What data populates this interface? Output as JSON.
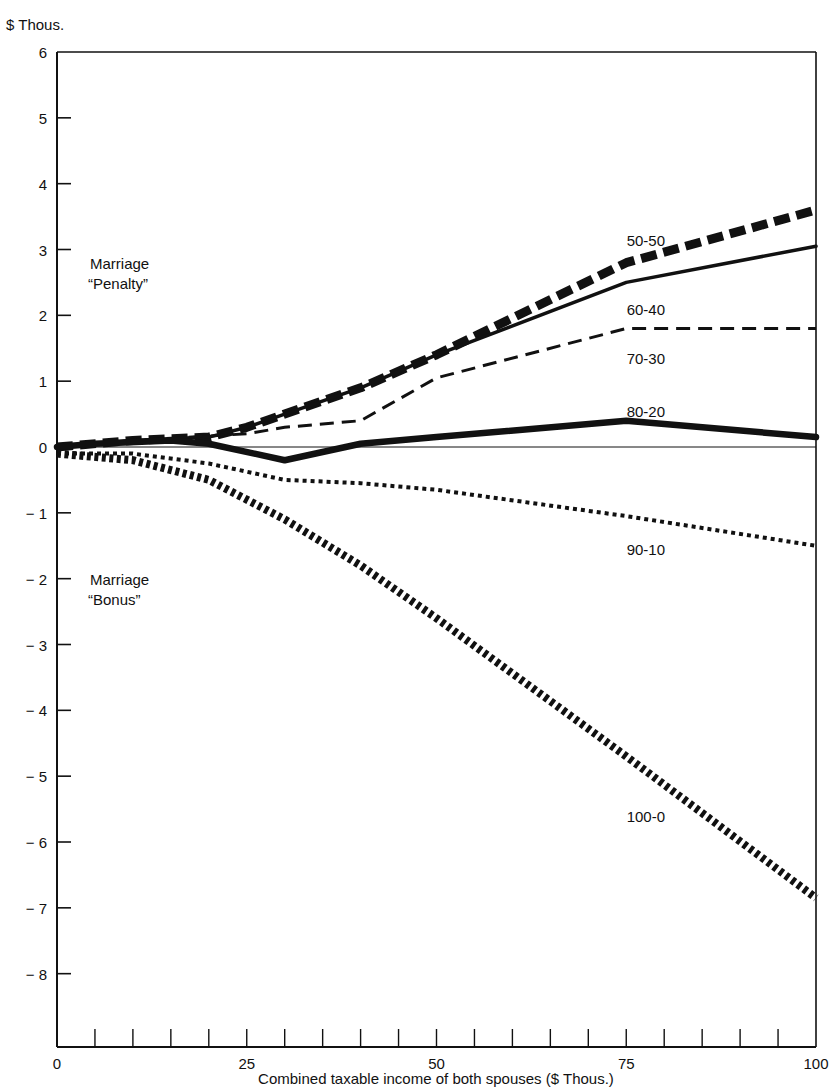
{
  "chart_data": {
    "type": "line",
    "title": "",
    "ylabel": "$ Thous.",
    "xlabel": "Combined taxable income of both spouses ($ Thous.)",
    "xlim": [
      0,
      100
    ],
    "ylim": [
      -9,
      6
    ],
    "x_ticks_labeled": [
      0,
      25,
      50,
      75,
      100
    ],
    "x_minor_tick_step": 5,
    "y_ticks": [
      6,
      5,
      4,
      3,
      2,
      1,
      0,
      -1,
      -2,
      -3,
      -4,
      -5,
      -6,
      -7,
      -8
    ],
    "y_tick_labels": [
      "6",
      "5",
      "4",
      "3",
      "2",
      "1",
      "0",
      "− 1",
      "− 2",
      "− 3",
      "− 4",
      "− 5",
      "− 6",
      "− 7",
      "− 8"
    ],
    "grid": false,
    "zero_line": true,
    "legend": "inline labels",
    "annotations": [
      {
        "text": "Marriage",
        "line2": "“Penalty”",
        "x": 4,
        "y": 2.7
      },
      {
        "text": "Marriage",
        "line2": "“Bonus”",
        "x": 4,
        "y": -2.1
      }
    ],
    "series": [
      {
        "name": "50-50",
        "style": "heavy-dash",
        "x": [
          0,
          10,
          20,
          25,
          30,
          40,
          50,
          75,
          100
        ],
        "values": [
          0,
          0.1,
          0.15,
          0.3,
          0.5,
          0.9,
          1.4,
          2.8,
          3.6
        ],
        "label_pos": [
          74,
          3.15
        ]
      },
      {
        "name": "60-40",
        "style": "solid-medium",
        "x": [
          0,
          10,
          20,
          25,
          30,
          40,
          50,
          75,
          100
        ],
        "values": [
          0,
          0.1,
          0.15,
          0.3,
          0.5,
          0.9,
          1.4,
          2.5,
          3.05
        ],
        "label_pos": [
          74,
          2.1
        ]
      },
      {
        "name": "70-30",
        "style": "dash",
        "x": [
          0,
          10,
          25,
          30,
          40,
          50,
          75,
          100
        ],
        "values": [
          0,
          0.1,
          0.2,
          0.3,
          0.4,
          1.05,
          1.8,
          1.8
        ],
        "label_pos": [
          74,
          1.35
        ]
      },
      {
        "name": "80-20",
        "style": "solid-heavy",
        "x": [
          0,
          5,
          15,
          20,
          30,
          40,
          50,
          75,
          100
        ],
        "values": [
          0,
          0.05,
          0.1,
          0.05,
          -0.2,
          0.05,
          0.15,
          0.4,
          0.15
        ],
        "label_pos": [
          74,
          0.55
        ]
      },
      {
        "name": "90-10",
        "style": "dotted",
        "x": [
          0,
          10,
          20,
          30,
          40,
          50,
          75,
          100
        ],
        "values": [
          -0.1,
          -0.1,
          -0.25,
          -0.5,
          -0.55,
          -0.65,
          -1.05,
          -1.5
        ],
        "label_pos": [
          74,
          -1.55
        ]
      },
      {
        "name": "100-0",
        "style": "heavy-dotted",
        "x": [
          0,
          10,
          20,
          30,
          40,
          50,
          75,
          100
        ],
        "values": [
          -0.1,
          -0.2,
          -0.5,
          -1.1,
          -1.8,
          -2.6,
          -4.7,
          -6.85
        ],
        "label_pos": [
          74,
          -5.6
        ]
      }
    ]
  }
}
